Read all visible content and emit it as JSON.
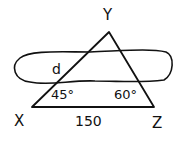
{
  "diagram": {
    "type": "geometry-triangle",
    "vertices": {
      "top": "Y",
      "left": "X",
      "right": "Z"
    },
    "angles": {
      "at_X": "45°",
      "at_Z": "60°"
    },
    "side_XZ_length": "150",
    "side_XY_label": "d",
    "stroke_color": "#111111",
    "background": "#ffffff"
  }
}
